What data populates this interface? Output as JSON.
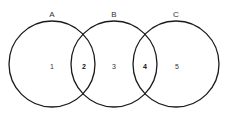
{
  "diagram": {
    "type": "venn",
    "sets": [
      {
        "id": "A",
        "label": "A",
        "cx": 52,
        "cy": 64,
        "r": 43
      },
      {
        "id": "B",
        "label": "B",
        "cx": 114,
        "cy": 64,
        "r": 43
      },
      {
        "id": "C",
        "label": "C",
        "cx": 176,
        "cy": 64,
        "r": 43
      }
    ],
    "regions": [
      {
        "label": "1",
        "x": 52,
        "y": 67,
        "bold": false,
        "description": "A only"
      },
      {
        "label": "2",
        "x": 84,
        "y": 67,
        "bold": true,
        "description": "A and B"
      },
      {
        "label": "3",
        "x": 114,
        "y": 67,
        "bold": false,
        "description": "B only"
      },
      {
        "label": "4",
        "x": 145,
        "y": 67,
        "bold": true,
        "description": "B and C"
      },
      {
        "label": "5",
        "x": 177,
        "y": 67,
        "bold": false,
        "description": "C only"
      }
    ]
  }
}
